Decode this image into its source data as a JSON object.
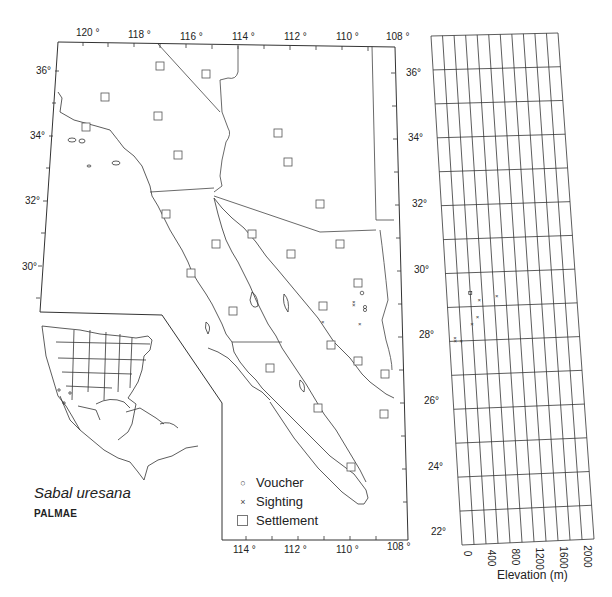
{
  "map": {
    "title": "Distribution map",
    "longitude_labels_top": [
      "120 °",
      "118 °",
      "116 °",
      "114 °",
      "112 °",
      "110 °",
      "108 °"
    ],
    "longitude_labels_bottom": [
      "114 °",
      "112 °",
      "110 °",
      "108 °"
    ],
    "latitude_labels_left": [
      "36°",
      "34°",
      "32°",
      "30°"
    ],
    "latitude_labels_right": [
      "36°",
      "34°",
      "32°",
      "30°",
      "28°",
      "26°",
      "24°",
      "22°"
    ]
  },
  "species": {
    "name": "Sabal uresana",
    "family": "PALMAE"
  },
  "legend": {
    "items": [
      {
        "symbol": "o",
        "label": "Voucher"
      },
      {
        "symbol": "×",
        "label": "Sighting"
      },
      {
        "symbol": "square",
        "label": "Settlement"
      }
    ]
  },
  "elevation_panel": {
    "axis_title": "Elevation (m)",
    "tick_labels": [
      "0",
      "400",
      "800",
      "1200",
      "1600",
      "2000"
    ]
  },
  "chart_data": {
    "type": "scatter",
    "xlabel": "Elevation (m)",
    "ylabel": "Latitude (°N)",
    "xlim": [
      0,
      2000
    ],
    "ylim": [
      22,
      37
    ],
    "grid": true,
    "series": [
      {
        "name": "Voucher",
        "points": [
          {
            "elevation": 300,
            "latitude": 29.4
          }
        ]
      },
      {
        "name": "Sighting",
        "points": [
          {
            "elevation": 0,
            "latitude": 28.1
          },
          {
            "elevation": 0,
            "latitude": 28.0
          },
          {
            "elevation": 100,
            "latitude": 28.0
          },
          {
            "elevation": 300,
            "latitude": 28.5
          },
          {
            "elevation": 400,
            "latitude": 28.7
          },
          {
            "elevation": 450,
            "latitude": 29.2
          },
          {
            "elevation": 750,
            "latitude": 29.3
          }
        ]
      }
    ]
  }
}
